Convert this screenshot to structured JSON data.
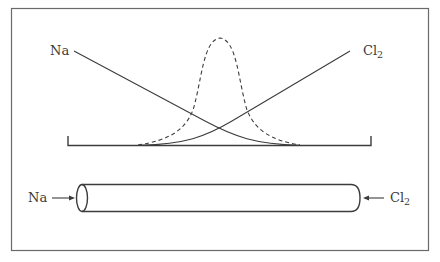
{
  "diagram": {
    "graph": {
      "left_label": "Na",
      "right_label_main": "Cl",
      "right_label_sub": "2",
      "curves": [
        {
          "name": "Na concentration",
          "style": "solid",
          "trend": "decreasing left to right"
        },
        {
          "name": "Cl2 concentration",
          "style": "solid",
          "trend": "increasing left to right"
        },
        {
          "name": "product distribution",
          "style": "dashed",
          "shape": "bell curve peaking at center"
        }
      ]
    },
    "tube": {
      "left_label": "Na",
      "right_label_main": "Cl",
      "right_label_sub": "2",
      "left_arrow": "arrow pointing right into tube",
      "right_arrow": "arrow pointing left into tube"
    },
    "colors": {
      "line": "#3c3c3c",
      "frame": "#6a6a6a",
      "text": "#3a3a3a",
      "background": "#ffffff"
    }
  }
}
